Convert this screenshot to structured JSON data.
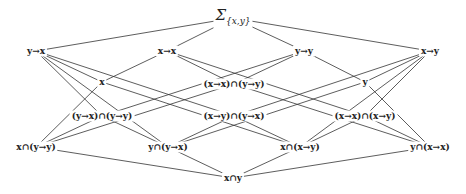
{
  "diagram": {
    "type": "hasse-lattice",
    "line_color": "#333333",
    "nodes": [
      {
        "id": "sigma",
        "label": "Σ",
        "sub": "{x,y}",
        "x": 233,
        "y": 18
      },
      {
        "id": "y_to_x",
        "label": "y→x",
        "x": 36,
        "y": 51
      },
      {
        "id": "x_to_x",
        "label": "x→x",
        "x": 167,
        "y": 51
      },
      {
        "id": "y_to_y",
        "label": "y→y",
        "x": 304,
        "y": 51
      },
      {
        "id": "x_to_y",
        "label": "x→y",
        "x": 430,
        "y": 51
      },
      {
        "id": "x",
        "label": "x",
        "x": 102,
        "y": 82
      },
      {
        "id": "xx_and_yy",
        "label": "(x→x)∩(y→y)",
        "x": 234,
        "y": 84
      },
      {
        "id": "y",
        "label": "y",
        "x": 365,
        "y": 82
      },
      {
        "id": "yx_and_yy",
        "label": "(y→x)∩(y→y)",
        "x": 102,
        "y": 116
      },
      {
        "id": "xy_and_yx",
        "label": "(x→y)∩(y→x)",
        "x": 234,
        "y": 116
      },
      {
        "id": "xx_and_xy",
        "label": "(x→x)∩(x→y)",
        "x": 365,
        "y": 116
      },
      {
        "id": "x_and_yy",
        "label": "x∩(y→y)",
        "x": 36,
        "y": 147
      },
      {
        "id": "y_and_yx",
        "label": "y∩(y→x)",
        "x": 168,
        "y": 147
      },
      {
        "id": "x_and_xy",
        "label": "x∩(x→y)",
        "x": 300,
        "y": 147
      },
      {
        "id": "y_and_xx",
        "label": "y∩(x→x)",
        "x": 430,
        "y": 147
      },
      {
        "id": "x_and_y",
        "label": "x∩y",
        "x": 233,
        "y": 178
      }
    ],
    "edges": [
      [
        "sigma",
        "y_to_x"
      ],
      [
        "sigma",
        "x_to_x"
      ],
      [
        "sigma",
        "y_to_y"
      ],
      [
        "sigma",
        "x_to_y"
      ],
      [
        "y_to_x",
        "x"
      ],
      [
        "y_to_x",
        "xy_and_yx"
      ],
      [
        "y_to_x",
        "yx_and_yy"
      ],
      [
        "y_to_x",
        "y_and_yx"
      ],
      [
        "x_to_x",
        "x"
      ],
      [
        "x_to_x",
        "xx_and_yy"
      ],
      [
        "x_to_x",
        "xx_and_xy"
      ],
      [
        "y_to_y",
        "xx_and_yy"
      ],
      [
        "y_to_y",
        "y"
      ],
      [
        "y_to_y",
        "yx_and_yy"
      ],
      [
        "x_to_y",
        "y"
      ],
      [
        "x_to_y",
        "xy_and_yx"
      ],
      [
        "x_to_y",
        "xx_and_xy"
      ],
      [
        "x_to_y",
        "x_and_xy"
      ],
      [
        "x",
        "x_and_yy"
      ],
      [
        "x",
        "x_and_xy"
      ],
      [
        "y",
        "y_and_yx"
      ],
      [
        "y",
        "y_and_xx"
      ],
      [
        "xx_and_yy",
        "x_and_yy"
      ],
      [
        "xx_and_yy",
        "y_and_xx"
      ],
      [
        "yx_and_yy",
        "x_and_yy"
      ],
      [
        "yx_and_yy",
        "y_and_yx"
      ],
      [
        "xy_and_yx",
        "y_and_yx"
      ],
      [
        "xy_and_yx",
        "x_and_xy"
      ],
      [
        "xx_and_xy",
        "x_and_xy"
      ],
      [
        "xx_and_xy",
        "y_and_xx"
      ],
      [
        "x_and_yy",
        "x_and_y"
      ],
      [
        "y_and_yx",
        "x_and_y"
      ],
      [
        "x_and_xy",
        "x_and_y"
      ],
      [
        "y_and_xx",
        "x_and_y"
      ]
    ]
  }
}
